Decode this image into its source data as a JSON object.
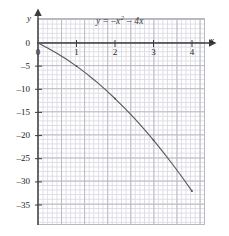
{
  "chart_data": {
    "type": "line",
    "title": "",
    "equation_label": "y = -x² - 4x",
    "equation_parts": {
      "lhs": "y",
      "eq": " = ",
      "term1_sign": "–",
      "term1_base": "x",
      "term1_exp": "2",
      "term2_sign": " – ",
      "term2": "4x"
    },
    "xlabel": "x",
    "ylabel": "y",
    "xlim": [
      0,
      4.3
    ],
    "ylim": [
      -38,
      2
    ],
    "x_ticks": [
      0,
      1,
      2,
      3,
      4
    ],
    "x_tick_labels": [
      "0",
      "1",
      "2",
      "3",
      "4"
    ],
    "y_ticks": [
      0,
      -5,
      -10,
      -15,
      -20,
      -25,
      -30,
      -35
    ],
    "y_tick_labels": [
      "0",
      "–5",
      "–10",
      "–15",
      "–20",
      "–25",
      "–30",
      "–35"
    ],
    "origin_label": "0",
    "grid": true,
    "grid_minor": true,
    "legend": "none",
    "axis_arrows": true,
    "series": [
      {
        "name": "y = -x² - 4x",
        "color": "#5a5a5a",
        "x": [
          0,
          0.25,
          0.5,
          0.75,
          1,
          1.25,
          1.5,
          1.75,
          2,
          2.25,
          2.5,
          2.75,
          3,
          3.25,
          3.5,
          3.75,
          4
        ],
        "y": [
          0,
          -1.0625,
          -2.25,
          -3.5625,
          -5,
          -6.5625,
          -8.25,
          -10.0625,
          -12,
          -14.0625,
          -16.25,
          -18.5625,
          -21,
          -23.5625,
          -26.25,
          -29.0625,
          -32
        ]
      }
    ],
    "marked_points": [
      {
        "x": 1,
        "y": -5
      },
      {
        "x": 2,
        "y": -12
      },
      {
        "x": 3,
        "y": -21
      },
      {
        "x": 4,
        "y": -32
      }
    ]
  },
  "colors": {
    "curve": "#5a5a5a",
    "axis": "#3c3c3c",
    "grid_major": "#b9b9c2",
    "grid_minor": "#dcdce4",
    "text": "#1b1b1b",
    "background": "#ffffff"
  }
}
